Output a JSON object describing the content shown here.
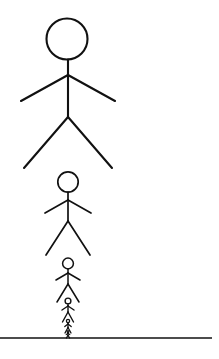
{
  "scene": {
    "title": "Recursive Stick Figures",
    "description": "A vertical sequence of six stick figures, each about half the height of the one above it, standing on a common vertical axis above a horizontal ground line.",
    "width": 219,
    "height": 359,
    "background_color": "#ffffff",
    "ink_color": "#111111",
    "figure_count": 6,
    "axis_x": 68
  },
  "ground": {
    "label": "ground-line",
    "x1": 0,
    "x2": 212,
    "y": 338,
    "thickness": 1.6,
    "color": "#111111"
  },
  "figures": [
    {
      "index": 1,
      "label": "stick-figure-largest",
      "scale": 1.0,
      "center_x": 68,
      "head_cx": 67,
      "head_cy": 39,
      "head_r": 20.5,
      "head_stroke": 2.1,
      "limb_stroke": 2.1,
      "neck_y1": 59.5,
      "neck_y2": 75,
      "body_y1": 75,
      "body_y2": 117,
      "arm_left_x": 21,
      "arm_left_y": 101,
      "arm_right_x": 115,
      "arm_right_y": 101,
      "leg_left_x": 24,
      "leg_left_y": 168,
      "leg_right_x": 112,
      "leg_right_y": 168
    },
    {
      "index": 2,
      "label": "stick-figure-second",
      "scale": 0.5,
      "center_x": 68,
      "head_cx": 68,
      "head_cy": 182,
      "head_r": 10.2,
      "head_stroke": 1.7,
      "limb_stroke": 1.7,
      "neck_y1": 192,
      "neck_y2": 200,
      "body_y1": 200,
      "body_y2": 221,
      "arm_left_x": 45,
      "arm_left_y": 213,
      "arm_right_x": 91,
      "arm_right_y": 213,
      "leg_left_x": 46,
      "leg_left_y": 255,
      "leg_right_x": 90,
      "leg_right_y": 255
    },
    {
      "index": 3,
      "label": "stick-figure-third",
      "scale": 0.26,
      "center_x": 68,
      "head_cx": 68,
      "head_cy": 263.5,
      "head_r": 5.4,
      "head_stroke": 1.5,
      "limb_stroke": 1.5,
      "neck_y1": 268.8,
      "neck_y2": 273,
      "body_y1": 273,
      "body_y2": 284,
      "arm_left_x": 56,
      "arm_left_y": 280,
      "arm_right_x": 80,
      "arm_right_y": 280,
      "leg_left_x": 57,
      "leg_left_y": 302,
      "leg_right_x": 79,
      "leg_right_y": 302
    },
    {
      "index": 4,
      "label": "stick-figure-fourth",
      "scale": 0.135,
      "center_x": 68,
      "head_cx": 68,
      "head_cy": 301,
      "head_r": 2.9,
      "head_stroke": 1.4,
      "limb_stroke": 1.4,
      "neck_y1": 303.8,
      "neck_y2": 306,
      "body_y1": 306,
      "body_y2": 312,
      "arm_left_x": 62,
      "arm_left_y": 310,
      "arm_right_x": 74,
      "arm_right_y": 310,
      "leg_left_x": 62.5,
      "leg_left_y": 322,
      "leg_right_x": 73.5,
      "leg_right_y": 322
    },
    {
      "index": 5,
      "label": "stick-figure-fifth",
      "scale": 0.07,
      "center_x": 68,
      "head_cx": 68,
      "head_cy": 321,
      "head_r": 1.6,
      "head_stroke": 1.3,
      "limb_stroke": 1.3,
      "neck_y1": 322.6,
      "neck_y2": 324,
      "body_y1": 324,
      "body_y2": 327.5,
      "arm_left_x": 64.8,
      "arm_left_y": 326.5,
      "arm_right_x": 71.2,
      "arm_right_y": 326.5,
      "leg_left_x": 65,
      "leg_left_y": 333,
      "leg_right_x": 71,
      "leg_right_y": 333
    },
    {
      "index": 6,
      "label": "stick-figure-smallest",
      "scale": 0.036,
      "center_x": 68,
      "head_cx": 68,
      "head_cy": 331.5,
      "head_r": 0.9,
      "head_stroke": 1.2,
      "limb_stroke": 1.2,
      "neck_y1": 332.4,
      "neck_y2": 333.2,
      "body_y1": 333.2,
      "body_y2": 335.2,
      "arm_left_x": 66.2,
      "arm_left_y": 334.6,
      "arm_right_x": 69.8,
      "arm_right_y": 334.6,
      "leg_left_x": 66.4,
      "leg_left_y": 338,
      "leg_right_x": 69.6,
      "leg_right_y": 338
    }
  ]
}
